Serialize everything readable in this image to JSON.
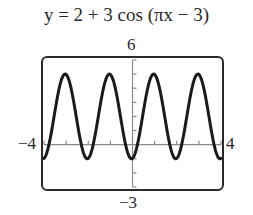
{
  "chart_data": {
    "type": "line",
    "title": "y = 2 + 3 cos (πx − 3)",
    "function": "y = 2 + 3*cos(pi*x - 3)",
    "xlim": [
      -4,
      4
    ],
    "ylim": [
      -3,
      6
    ],
    "xscale": 1,
    "yscale": 1,
    "tick_labels": {
      "xmin": "−4",
      "xmax": "4",
      "ymax": "6",
      "ymin": "−3"
    },
    "series": [
      {
        "name": "y = 2 + 3 cos(πx − 3)",
        "amplitude": 3,
        "midline": 2,
        "period": 2,
        "max": 5,
        "min": -1
      }
    ],
    "grid": false,
    "legend": false,
    "colors": {
      "curve": "#1a1a1a",
      "axes": "#8a8a8a",
      "frame": "#2a2a2a"
    }
  }
}
